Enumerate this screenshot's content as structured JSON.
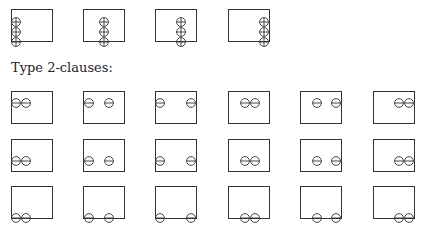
{
  "section_label": "Type 2-clauses:",
  "type1_row": {
    "symbol": "oplus",
    "boxes": [
      {
        "x": 11,
        "y": 9,
        "syms": [
          [
            0,
            3
          ],
          [
            0,
            13
          ],
          [
            0,
            23
          ]
        ]
      },
      {
        "x": 83,
        "y": 9,
        "syms": [
          [
            16,
            3
          ],
          [
            16,
            13
          ],
          [
            16,
            23
          ]
        ]
      },
      {
        "x": 155,
        "y": 9,
        "syms": [
          [
            21,
            3
          ],
          [
            21,
            13
          ],
          [
            21,
            23
          ]
        ]
      },
      {
        "x": 228,
        "y": 9,
        "syms": [
          [
            31,
            3
          ],
          [
            31,
            13
          ],
          [
            31,
            23
          ]
        ]
      }
    ]
  },
  "type2_grid": {
    "symbol": "ominus",
    "columns_x": [
      11,
      83,
      155,
      228,
      300,
      373
    ],
    "rows_y": [
      91,
      139,
      186
    ],
    "rows": [
      {
        "position": "top",
        "sym_y": 2
      },
      {
        "position": "middle",
        "sym_y": 12
      },
      {
        "position": "bottom",
        "sym_y": 22
      }
    ],
    "column_sym_x": [
      [
        0,
        10
      ],
      [
        1,
        21
      ],
      [
        0,
        31
      ],
      [
        12,
        22
      ],
      [
        12,
        31
      ],
      [
        21,
        31
      ]
    ]
  },
  "colors": {
    "stroke": "#333333",
    "background": "#ffffff"
  }
}
